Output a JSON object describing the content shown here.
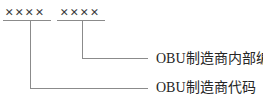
{
  "diagram": {
    "groups": [
      {
        "symbols": "××××",
        "label": "OBU制造商代码"
      },
      {
        "symbols": "××××",
        "label": "OBU制造商内部编码"
      }
    ],
    "colors": {
      "line": "#8b8b8b",
      "symbol_text": "#3c3c3c",
      "label_text": "#262626",
      "background": "#ffffff"
    }
  }
}
